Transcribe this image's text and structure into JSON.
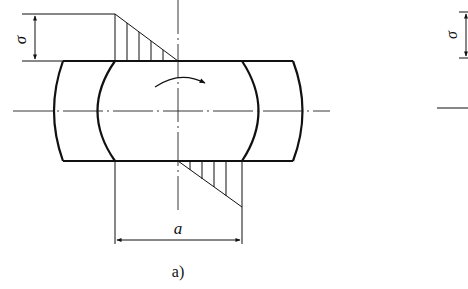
{
  "figure": {
    "panel_label": "a)",
    "dimension_label": "a",
    "stress_symbol": "σ",
    "right_panel_stress_symbol": "σ",
    "rotation_arrow": "clockwise-rotation-arrow",
    "colors": {
      "line": "#111111",
      "background": "#ffffff"
    }
  }
}
